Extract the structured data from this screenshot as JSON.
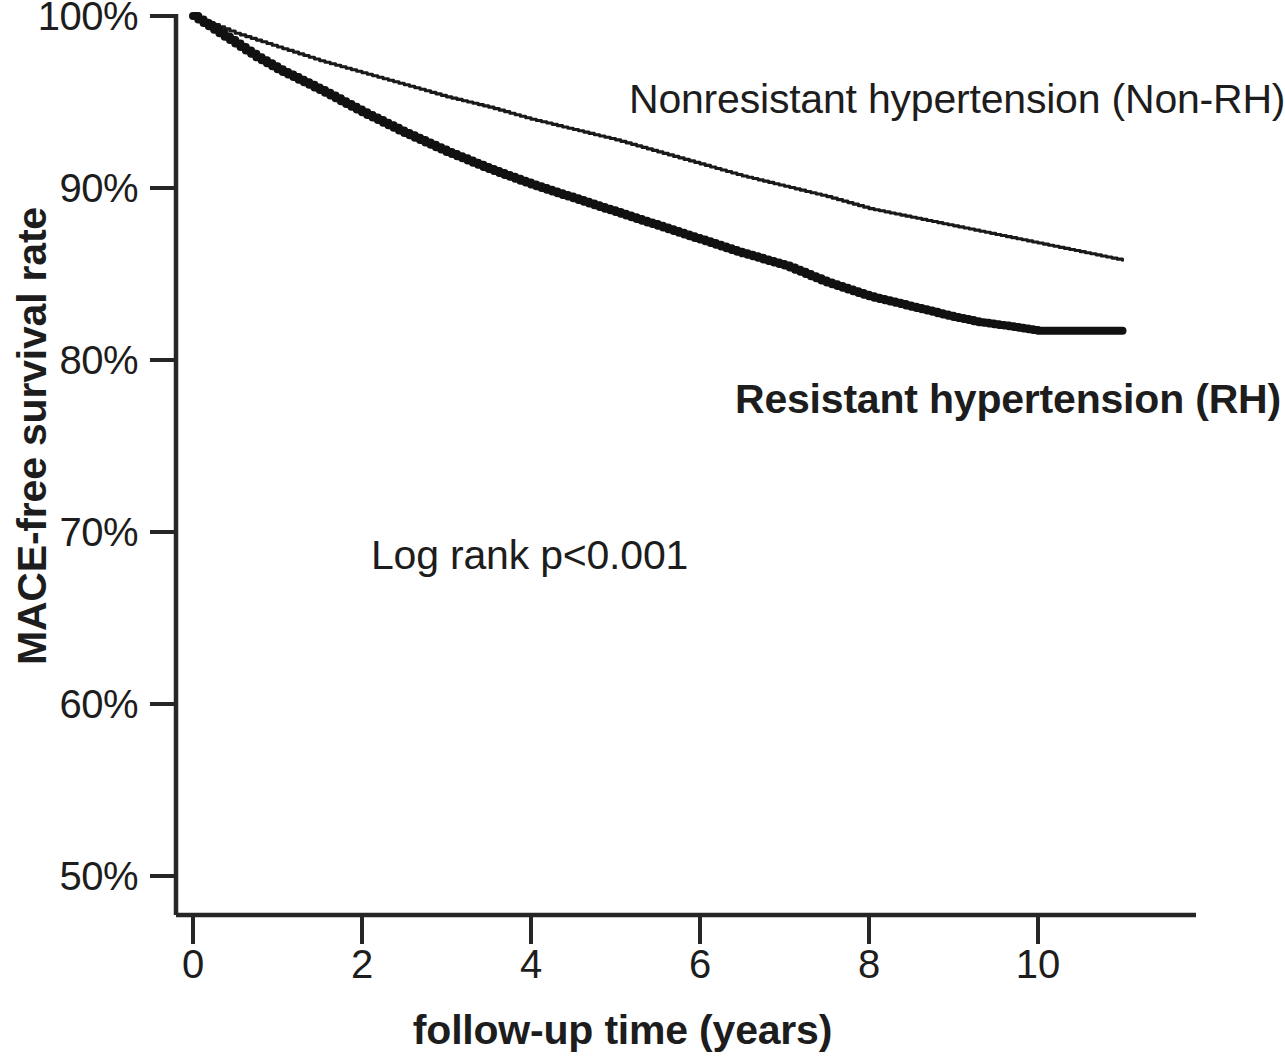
{
  "chart_data": {
    "type": "line",
    "title": "",
    "xlabel": "follow-up time (years)",
    "ylabel": "MACE-free survival rate",
    "xlim": [
      0,
      11.9
    ],
    "ylim": [
      48.5,
      100
    ],
    "grid": false,
    "legend_position": "inline-annotations",
    "x_ticks": [
      "0",
      "2",
      "4",
      "6",
      "8",
      "10"
    ],
    "x_tick_values": [
      0,
      2,
      4,
      6,
      8,
      10
    ],
    "y_ticks": [
      "50%",
      "60%",
      "70%",
      "80%",
      "90%",
      "100%"
    ],
    "y_tick_values": [
      50,
      60,
      70,
      80,
      90,
      100
    ],
    "annotations": [
      {
        "name": "log-rank",
        "text": "Log rank p<0.001",
        "x": 2.1,
        "y": 68.4
      }
    ],
    "series": [
      {
        "name": "Nonresistant hypertension (Non-RH)",
        "short_name": "Non-RH",
        "style": "thin",
        "color": "#1a1a1a",
        "label_x": 5.2,
        "label_y": 95.6,
        "x": [
          0,
          0.25,
          0.5,
          0.75,
          1,
          1.5,
          2,
          2.5,
          3,
          3.5,
          4,
          4.5,
          5,
          5.5,
          6,
          6.5,
          7,
          7.5,
          8,
          8.5,
          9,
          9.5,
          10,
          10.5,
          11.0
        ],
        "values": [
          100,
          99.5,
          99.0,
          98.6,
          98.2,
          97.4,
          96.7,
          96.0,
          95.3,
          94.7,
          94.0,
          93.4,
          92.8,
          92.1,
          91.4,
          90.7,
          90.1,
          89.5,
          88.8,
          88.3,
          87.8,
          87.3,
          86.8,
          86.3,
          85.8
        ]
      },
      {
        "name": "Resistant hypertension (RH)",
        "short_name": "RH",
        "style": "thick",
        "color": "#111111",
        "label_x": 6.6,
        "label_y": 78.0,
        "x": [
          0,
          0.25,
          0.5,
          0.75,
          1,
          1.5,
          2,
          2.5,
          3,
          3.5,
          4,
          4.5,
          5,
          5.5,
          6,
          6.5,
          7,
          7.25,
          7.5,
          8,
          8.5,
          9,
          9.3,
          9.6,
          10.0,
          10.5,
          11.0
        ],
        "values": [
          100,
          99.2,
          98.4,
          97.6,
          96.9,
          95.7,
          94.4,
          93.2,
          92.1,
          91.1,
          90.2,
          89.4,
          88.6,
          87.8,
          87.0,
          86.2,
          85.5,
          85.0,
          84.5,
          83.7,
          83.1,
          82.5,
          82.2,
          82.0,
          81.7,
          81.7,
          81.7
        ]
      }
    ]
  },
  "figure": {
    "xaxis_title": "follow-up time (years)",
    "yaxis_title": "MACE-free survival rate",
    "log_rank": "Log rank p<0.001",
    "label_nonrh": "Nonresistant hypertension (Non-RH)",
    "label_rh": "Resistant hypertension (RH)",
    "ytick_100": "100%",
    "ytick_90": "90%",
    "ytick_80": "80%",
    "ytick_70": "70%",
    "ytick_60": "60%",
    "ytick_50": "50%",
    "xtick_0": "0",
    "xtick_2": "2",
    "xtick_4": "4",
    "xtick_6": "6",
    "xtick_8": "8",
    "xtick_10": "10"
  }
}
